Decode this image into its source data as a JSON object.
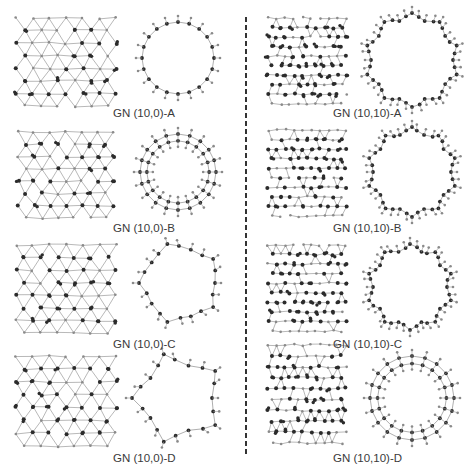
{
  "figure": {
    "type": "molecular-structure-panels",
    "columns": [
      {
        "family": "GN (10,0)",
        "panels": [
          {
            "id": "10-0-A",
            "label": "GN (10,0)-A",
            "ring_units": 20,
            "ring_style": "single"
          },
          {
            "id": "10-0-B",
            "label": "GN (10,0)-B",
            "ring_units": 20,
            "ring_style": "double"
          },
          {
            "id": "10-0-C",
            "label": "GN (10,0)-C",
            "ring_units": 10,
            "ring_style": "zigzag"
          },
          {
            "id": "10-0-D",
            "label": "GN (10,0)-D",
            "ring_units": 10,
            "ring_style": "hexagonal"
          }
        ]
      },
      {
        "family": "GN (10,10)",
        "panels": [
          {
            "id": "10-10-A",
            "label": "GN (10,10)-A",
            "ring_units": 20,
            "ring_style": "zigzag"
          },
          {
            "id": "10-10-B",
            "label": "GN (10,10)-B",
            "ring_units": 20,
            "ring_style": "zigzag"
          },
          {
            "id": "10-10-C",
            "label": "GN (10,10)-C",
            "ring_units": 20,
            "ring_style": "zigzag"
          },
          {
            "id": "10-10-D",
            "label": "GN (10,10)-D",
            "ring_units": 20,
            "ring_style": "double"
          }
        ]
      }
    ],
    "colors": {
      "carbon": "#2b2b2b",
      "hydrogen": "#8a8a8a",
      "bond": "#9a9a9a",
      "divider": "#333333",
      "label": "#3a3a3a"
    }
  }
}
